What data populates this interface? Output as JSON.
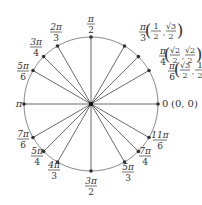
{
  "diagram": {
    "type": "unit-circle",
    "center": [
      91,
      104
    ],
    "radius": 67,
    "colors": {
      "circle": "#8a8a8a",
      "radius_line": "#6b6b6b",
      "point": "#333333",
      "text": "#333333",
      "background": "#ffffff"
    },
    "angles": [
      {
        "id": "0",
        "deg": 0,
        "num": "0",
        "den": "",
        "coord": "(0, 0)",
        "label_pos": [
          162,
          107
        ],
        "anchor": "start",
        "inline": true
      },
      {
        "id": "pi-6",
        "deg": 30,
        "num": "π",
        "den": "6",
        "coord": "(√3/2, 1/2)",
        "label_pos": [
          172,
          72
        ],
        "anchor": "middle"
      },
      {
        "id": "pi-4",
        "deg": 45,
        "num": "π",
        "den": "4",
        "coord": "(√2/2, √2/2)",
        "label_pos": [
          163,
          57
        ],
        "anchor": "middle"
      },
      {
        "id": "pi-3",
        "deg": 60,
        "num": "π",
        "den": "3",
        "coord": "(1/2, √3/2)",
        "label_pos": [
          143,
          33
        ],
        "anchor": "middle"
      },
      {
        "id": "pi-2",
        "deg": 90,
        "num": "π",
        "den": "2",
        "coord": "",
        "label_pos": [
          91,
          25
        ],
        "anchor": "middle"
      },
      {
        "id": "2pi-3",
        "deg": 120,
        "num": "2π",
        "den": "3",
        "coord": "",
        "label_pos": [
          56,
          33
        ],
        "anchor": "middle"
      },
      {
        "id": "3pi-4",
        "deg": 135,
        "num": "3π",
        "den": "4",
        "coord": "",
        "label_pos": [
          36,
          48
        ],
        "anchor": "middle"
      },
      {
        "id": "5pi-6",
        "deg": 150,
        "num": "5π",
        "den": "6",
        "coord": "",
        "label_pos": [
          23,
          72
        ],
        "anchor": "middle"
      },
      {
        "id": "pi",
        "deg": 180,
        "num": "π",
        "den": "",
        "coord": "",
        "label_pos": [
          19,
          107
        ],
        "anchor": "middle",
        "inline": true
      },
      {
        "id": "7pi-6",
        "deg": 210,
        "num": "7π",
        "den": "6",
        "coord": "",
        "label_pos": [
          23,
          140
        ],
        "anchor": "middle"
      },
      {
        "id": "5pi-4",
        "deg": 225,
        "num": "5π",
        "den": "4",
        "coord": "",
        "label_pos": [
          37,
          157
        ],
        "anchor": "middle"
      },
      {
        "id": "4pi-3",
        "deg": 240,
        "num": "4π",
        "den": "3",
        "coord": "",
        "label_pos": [
          54,
          171
        ],
        "anchor": "middle"
      },
      {
        "id": "3pi-2",
        "deg": 270,
        "num": "3π",
        "den": "2",
        "coord": "",
        "label_pos": [
          91,
          187
        ],
        "anchor": "middle"
      },
      {
        "id": "5pi-3",
        "deg": 300,
        "num": "5π",
        "den": "3",
        "coord": "",
        "label_pos": [
          128,
          173
        ],
        "anchor": "middle"
      },
      {
        "id": "7pi-4",
        "deg": 315,
        "num": "7π",
        "den": "4",
        "coord": "",
        "label_pos": [
          145,
          157
        ],
        "anchor": "middle"
      },
      {
        "id": "11pi-6",
        "deg": 330,
        "num": "11π",
        "den": "6",
        "coord": "",
        "label_pos": [
          160,
          141
        ],
        "anchor": "middle"
      }
    ],
    "coord_labels": {
      "pi-3": {
        "x": 153,
        "y": 31,
        "a_num": "1",
        "a_den": "2",
        "b_num": "√3",
        "b_den": "2"
      },
      "pi-4": {
        "x": 172,
        "y": 55,
        "a_num": "√2",
        "a_den": "2",
        "b_num": "√2",
        "b_den": "2"
      },
      "pi-6": {
        "x": 182,
        "y": 70,
        "a_num": "√3",
        "a_den": "2",
        "b_num": "1",
        "b_den": "2"
      }
    },
    "zero_label": {
      "angle": "0",
      "coord": "(0, 0)"
    }
  }
}
